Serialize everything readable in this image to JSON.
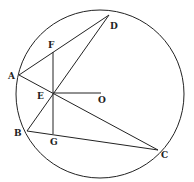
{
  "diagram": {
    "type": "geometry-circle-chords",
    "circle": {
      "center_label": "O",
      "cx": 100,
      "cy": 94,
      "r": 84
    },
    "points": {
      "A": {
        "label": "A",
        "x": 19,
        "y": 75
      },
      "B": {
        "label": "B",
        "x": 27,
        "y": 131
      },
      "C": {
        "label": "C",
        "x": 158,
        "y": 150
      },
      "D": {
        "label": "D",
        "x": 109,
        "y": 15
      },
      "E": {
        "label": "E",
        "x": 53,
        "y": 93
      },
      "F": {
        "label": "F",
        "x": 53,
        "y": 52
      },
      "G": {
        "label": "G",
        "x": 53,
        "y": 134
      },
      "O": {
        "label": "O",
        "x": 101,
        "y": 93
      }
    },
    "segments": [
      [
        "A",
        "D"
      ],
      [
        "A",
        "C"
      ],
      [
        "B",
        "D"
      ],
      [
        "B",
        "C"
      ],
      [
        "F",
        "G"
      ],
      [
        "E",
        "O"
      ]
    ],
    "stroke_color": "#222222",
    "background": "#ffffff"
  }
}
